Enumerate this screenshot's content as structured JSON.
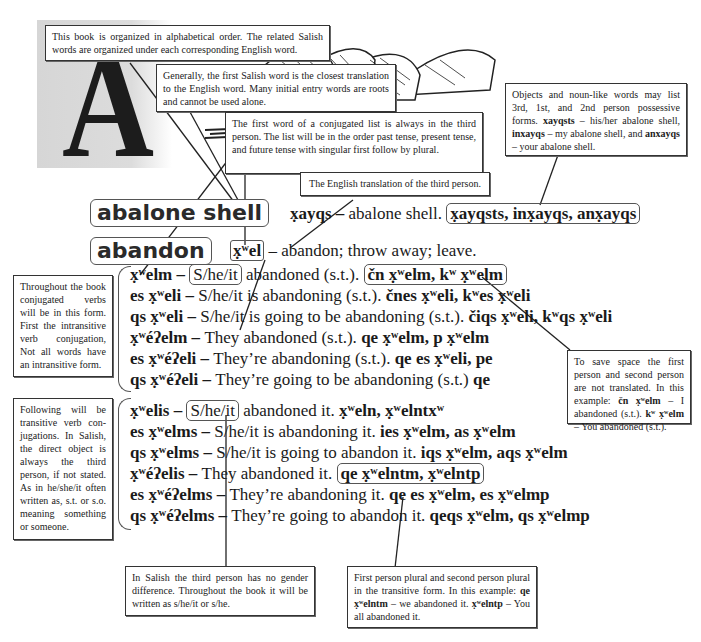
{
  "letter": "A",
  "notes": {
    "alphabetical": "This book is organized in alphabetical order.  The related Salish words are organized under each corresponding English word.",
    "first_salish_word": "Generally, the first Salish word is the closest translation to the English word.  Many initial entry words are roots and cannot be used alone.",
    "conjugated_list": "The first word of a conjugated list is always in the third person.  The list will be in the order past tense, present tense, and future tense with singular first follow by plural.",
    "english_translation": "The English translation of the third person.",
    "possessive": {
      "intro": "Objects and noun-like words may list 3rd, 1st, and 2nd person possessive forms.",
      "form1": "xayqsts",
      "gloss1": " – his/her abalone shell, ",
      "form2": "inxayqs",
      "gloss2": " – my abalone shell, and ",
      "form3": "anxayqs",
      "gloss3": " – your abalone shell."
    },
    "intransitive": "Throughout the book conjugated verbs will be in this form. First the intransitive verb conjugation, Not all words have an intransitive form.",
    "transitive": "Following will be transitive verb con-jugations. In Salish, the direct object is always the third person, if not stated. As in he/she/it often written as, s.t. or s.o. meaning something or someone.",
    "first_second_person": {
      "intro": "To save space the first person and second person are not translated. In this example: ",
      "form1": "čn x̣ʷelm",
      "gloss1": " – I abandoned (s.t.).  ",
      "form2": "kʷ x̣ʷelm",
      "gloss2": " – You abandoned (s.t.)."
    },
    "gender": "In Salish the third person has no gender difference. Throughout the book it will be written as s/he/it or s/he.",
    "plural_transitive": {
      "intro": "First person plural and second person plural in the transitive form. In this example: ",
      "form1": "qe x̣ʷelntm",
      "gloss1": " – we abandoned it.  ",
      "form2": "x̣ʷelntp",
      "gloss2": " – You all abandoned it."
    }
  },
  "entries": [
    {
      "headword": "abalone shell",
      "salish": "x̣ayqs",
      "dash": " – ",
      "gloss": "abalone shell.",
      "possessives": "x̣ayqsts, inx̣ayqs, anx̣ayqs"
    },
    {
      "headword": "abandon",
      "salish": "x̣ʷel",
      "dash": " – ",
      "gloss": "abandon; throw away; leave."
    }
  ],
  "intransitive_rows": [
    {
      "form": "x̣ʷelm – ",
      "subj": "S/he/it",
      "gloss": " abandoned (s.t.).",
      "others": "čn x̣ʷelm, kʷ x̣ʷelm"
    },
    {
      "form": "es x̣ʷeli – ",
      "subj": "S/he/it",
      "gloss": " is abandoning (s.t.).  ",
      "others": "čnes x̣ʷeli, kʷes x̣ʷeli"
    },
    {
      "form": "qs x̣ʷeli – ",
      "subj": "S/he/it",
      "gloss": " is going to be abandoning (s.t.).  ",
      "others": "čiqs x̣ʷeli, kʷqs x̣ʷeli"
    },
    {
      "form": "x̣ʷéʔelm – ",
      "subj": "They",
      "gloss": " abandoned (s.t.).  ",
      "others": "qe x̣ʷelm, p x̣ʷelm"
    },
    {
      "form": "es x̣ʷéʔeli – ",
      "subj": "They’re",
      "gloss": " abandoning (s.t.).  ",
      "others": "qe es x̣ʷeli, pe"
    },
    {
      "form": "qs x̣ʷéʔeli – ",
      "subj": "They’re",
      "gloss": " going to be abandoning (s.t.)  ",
      "others": "qe"
    }
  ],
  "transitive_rows": [
    {
      "form": "x̣ʷelis – ",
      "subj": "S/he/it",
      "gloss": " abandoned it.  ",
      "others": "x̣ʷeln, x̣ʷelntxʷ"
    },
    {
      "form": "es x̣ʷelms – ",
      "subj": "S/he/it",
      "gloss": " is abandoning it.  ",
      "others": "ies x̣ʷelm, as x̣ʷelm"
    },
    {
      "form": "qs x̣ʷelms – ",
      "subj": "S/he/it",
      "gloss": " is going to abandon it.  ",
      "others": "iqs x̣ʷelm, aqs x̣ʷelm"
    },
    {
      "form": "x̣ʷéʔelis – ",
      "subj": "They",
      "gloss": " abandoned it. ",
      "others": "qe x̣ʷelntm, x̣ʷelntp"
    },
    {
      "form": "es x̣ʷéʔelms – ",
      "subj": "They’re",
      "gloss": " abandoning it.  ",
      "others": "qe es x̣ʷelm, es x̣ʷelmp"
    },
    {
      "form": "qs x̣ʷéʔelms – ",
      "subj": "They’re",
      "gloss": " going to abandon it.  ",
      "others": "qeqs x̣ʷelm, qs x̣ʷelmp"
    }
  ]
}
